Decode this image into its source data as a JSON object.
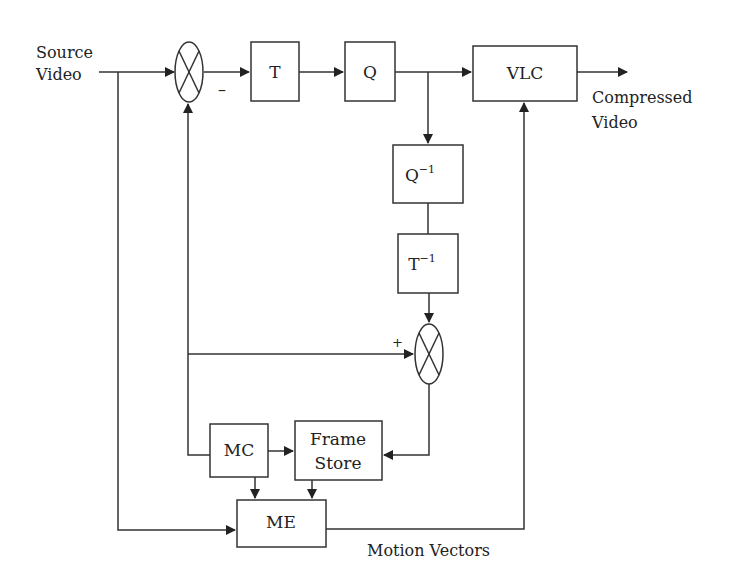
{
  "diagram": {
    "input_label_line1": "Source",
    "input_label_line2": "Video",
    "output_label_line1": "Compressed",
    "output_label_line2": "Video",
    "motion_vectors_label": "Motion Vectors",
    "minus_sign": "–",
    "plus_sign": "+",
    "blocks": {
      "transform": "T",
      "quantizer": "Q",
      "vlc": "VLC",
      "inv_quant_base": "Q",
      "inv_quant_sup": "−1",
      "inv_transform_base": "T",
      "inv_transform_sup": "−1",
      "mc": "MC",
      "frame_store_line1": "Frame",
      "frame_store_line2": "Store",
      "me": "ME"
    },
    "colors": {
      "stroke": "#333333",
      "text": "#222222",
      "background": "#ffffff"
    }
  }
}
